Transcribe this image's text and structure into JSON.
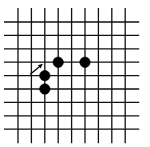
{
  "diagram": {
    "type": "go-board-fragment",
    "grid": {
      "columns": 9,
      "rows": 9,
      "origin_x": 18,
      "origin_y": 22,
      "spacing": 13.4,
      "line_extend_left": 14,
      "line_extend_right": 14,
      "line_extend_top": 14,
      "line_extend_bottom": 14,
      "line_color": "#111111"
    },
    "stones": [
      {
        "color": "black",
        "col": 3,
        "row": 3
      },
      {
        "color": "black",
        "col": 5,
        "row": 3
      },
      {
        "color": "black",
        "col": 2,
        "row": 4
      },
      {
        "color": "black",
        "col": 2,
        "row": 5
      }
    ],
    "markers": [
      {
        "type": "arrow",
        "target_col": 2,
        "target_row": 3,
        "from_dx": -12,
        "from_dy": 10
      }
    ],
    "stone_color": "#000000",
    "stone_radius": 5.2
  }
}
